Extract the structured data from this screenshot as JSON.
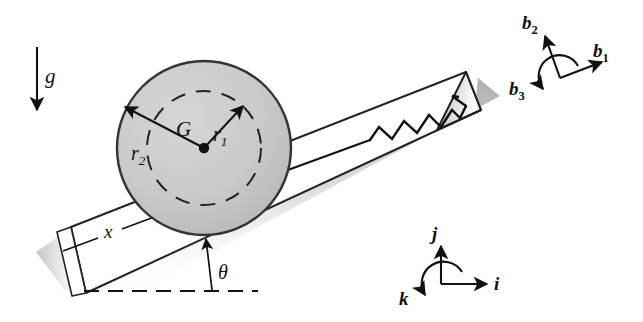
{
  "figure": {
    "background_color": "#ffffff",
    "line_color": "#111111"
  },
  "colors": {
    "disk_fill": "#c8c8c8",
    "disk_edge": "#333333",
    "incline_fill": "#ffffff",
    "incline_edge": "#222222",
    "shadow": "#9a9a9a",
    "ink": "#111111"
  },
  "labels": {
    "gravity": "g",
    "center_of_mass": "G",
    "inner_radius": "r",
    "inner_radius_sub": "1",
    "outer_radius": "r",
    "outer_radius_sub": "2",
    "displacement": "x",
    "incline_angle": "θ"
  },
  "body_frame": {
    "name": "b-frame",
    "axis_1": "b",
    "axis_1_sub": "1",
    "axis_2": "b",
    "axis_2_sub": "2",
    "axis_3": "b",
    "axis_3_sub": "3"
  },
  "inertial_frame": {
    "name": "ijk-frame",
    "axis_i": "i",
    "axis_j": "j",
    "axis_k": "k"
  },
  "geometry": {
    "incline_angle_degrees": 23,
    "disk_center_x": 204,
    "disk_center_y": 148,
    "disk_outer_radius": 87,
    "disk_inner_radius": 57,
    "spring_coils": 5
  }
}
